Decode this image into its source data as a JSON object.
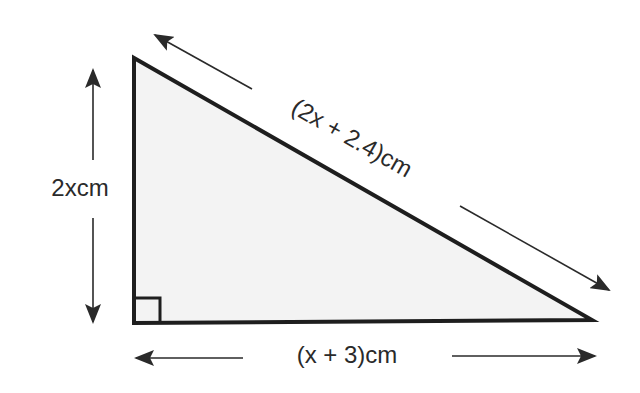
{
  "diagram": {
    "type": "right-triangle",
    "colors": {
      "stroke": "#1e1e1e",
      "fill": "#f3f3f3",
      "arrow": "#2a2a2a",
      "text": "#2a2a2a",
      "background": "#ffffff"
    },
    "vertices": {
      "top": [
        134,
        58
      ],
      "bottom_left": [
        134,
        323
      ],
      "bottom_right": [
        592,
        320
      ]
    },
    "right_angle_marker": "bottom-left",
    "labels": {
      "vertical_side": "2xcm",
      "base": "(x + 3)cm",
      "hypotenuse": "(2x + 2.4)cm"
    }
  }
}
